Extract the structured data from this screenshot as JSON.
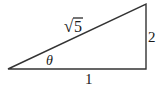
{
  "diagram": {
    "type": "right-triangle",
    "labels": {
      "hypotenuse": "5",
      "hypotenuse_radical": "√",
      "opposite": "2",
      "adjacent": "1",
      "angle": "θ"
    },
    "colors": {
      "stroke": "#333333",
      "text": "#1a1a1a",
      "background": "#ffffff"
    }
  }
}
